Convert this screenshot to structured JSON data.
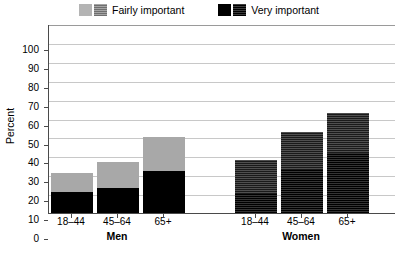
{
  "legend": {
    "items": [
      {
        "label": "Fairly important",
        "swatches": [
          "light-solid",
          "light-textured"
        ]
      },
      {
        "label": "Very important",
        "swatches": [
          "dark-solid",
          "dark-textured"
        ]
      }
    ]
  },
  "axes": {
    "y_title": "Percent",
    "y_ticks": [
      "100",
      "90",
      "80",
      "70",
      "60",
      "50",
      "40",
      "30",
      "20",
      "10",
      "0"
    ],
    "x_ticks": [
      "18–44",
      "45–64",
      "65+",
      "18–44",
      "45–64",
      "65+"
    ],
    "group_labels": [
      "Men",
      "Women"
    ]
  },
  "chart_data": {
    "type": "bar",
    "title": "",
    "subtitle": "",
    "xlabel": "",
    "ylabel": "Percent",
    "ylim": [
      0,
      100
    ],
    "ytick_step": 10,
    "grid": true,
    "stacked": true,
    "legend_position": "top-center",
    "groups": [
      "Men",
      "Women"
    ],
    "categories": [
      "18–44",
      "45–64",
      "65+",
      "18–44",
      "45–64",
      "65+"
    ],
    "bar_groups": [
      {
        "group": "Men",
        "category": "18–44",
        "very_important": 11,
        "fairly_important": 10,
        "total": 21,
        "style": "solid"
      },
      {
        "group": "Men",
        "category": "45–64",
        "very_important": 13,
        "fairly_important": 14,
        "total": 27,
        "style": "solid"
      },
      {
        "group": "Men",
        "category": "65+",
        "very_important": 22,
        "fairly_important": 18,
        "total": 40,
        "style": "solid"
      },
      {
        "group": "Women",
        "category": "18–44",
        "very_important": 10,
        "fairly_important": 18,
        "total": 28,
        "style": "textured"
      },
      {
        "group": "Women",
        "category": "45–64",
        "very_important": 23,
        "fairly_important": 20,
        "total": 43,
        "style": "textured"
      },
      {
        "group": "Women",
        "category": "65+",
        "very_important": 32,
        "fairly_important": 21,
        "total": 53,
        "style": "textured"
      }
    ],
    "series": [
      {
        "name": "Very important",
        "values": [
          11,
          13,
          22,
          10,
          23,
          32
        ]
      },
      {
        "name": "Fairly important",
        "values": [
          10,
          14,
          18,
          18,
          20,
          21
        ]
      }
    ],
    "totals": [
      21,
      27,
      40,
      28,
      43,
      53
    ],
    "colors": {
      "fairly_important_solid": "#a8a8a8",
      "very_important_solid": "#000000",
      "fairly_important_textured": "#2a2a2a",
      "very_important_textured": "#111111",
      "gridline": "#c8c8c8",
      "axis": "#4a4a4a"
    }
  }
}
